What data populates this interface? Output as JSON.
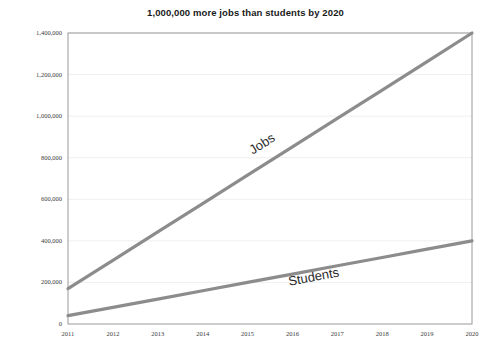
{
  "chart_data": {
    "type": "line",
    "title": "1,000,000 more jobs than students by 2020",
    "xlabel": "",
    "ylabel": "",
    "categories": [
      "2011",
      "2012",
      "2013",
      "2014",
      "2015",
      "2016",
      "2017",
      "2018",
      "2019",
      "2020"
    ],
    "x": [
      2011,
      2012,
      2013,
      2014,
      2015,
      2016,
      2017,
      2018,
      2019,
      2020
    ],
    "ylim": [
      0,
      1400000
    ],
    "yticks": [
      0,
      200000,
      400000,
      600000,
      800000,
      1000000,
      1200000,
      1400000
    ],
    "ytick_labels": [
      "0",
      "200,000",
      "400,000",
      "600,000",
      "800,000",
      "1,000,000",
      "1,200,000",
      "1,400,000"
    ],
    "grid": true,
    "legend": "inline-labels",
    "series": [
      {
        "name": "Jobs",
        "color": "#8c8c8c",
        "values": [
          170000,
          306000,
          443000,
          579000,
          716000,
          852000,
          989000,
          1125000,
          1262000,
          1400000
        ],
        "label_text": "Jobs"
      },
      {
        "name": "Students",
        "color": "#8c8c8c",
        "values": [
          40000,
          80000,
          120000,
          160000,
          200000,
          240000,
          280000,
          320000,
          360000,
          400000
        ],
        "label_text": "Students"
      }
    ],
    "annotations": [
      {
        "text": "Jobs",
        "x": 2015.4,
        "y": 910000
      },
      {
        "text": "Students",
        "x": 2016.5,
        "y": 265000
      }
    ]
  },
  "axis": {
    "y_labels": [
      "1,400,000",
      "1,200,000",
      "1,000,000",
      "800,000",
      "600,000",
      "400,000",
      "200,000",
      "0"
    ],
    "x_labels": [
      "2011",
      "2012",
      "2013",
      "2014",
      "2015",
      "2016",
      "2017",
      "2018",
      "2019",
      "2020"
    ]
  },
  "colors": {
    "line": "#8c8c8c",
    "grid": "#efefef",
    "axis": "#9a9a9a",
    "text": "#3a3a3a",
    "title": "#1a1a1a",
    "background": "#ffffff"
  }
}
